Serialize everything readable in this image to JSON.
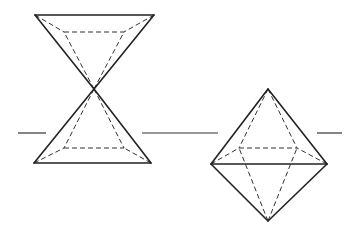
{
  "figure": {
    "stroke_color": "#222222",
    "background": "#ffffff"
  },
  "plane_line": {
    "y": 133,
    "segments": [
      [
        18,
        46
      ],
      [
        142,
        218
      ],
      [
        317,
        342
      ]
    ]
  },
  "double_pyramid": {
    "apex": [
      94,
      89
    ],
    "upper": {
      "front_left": [
        35,
        15
      ],
      "front_right": [
        154,
        15
      ],
      "back_left": [
        64,
        32
      ],
      "back_right": [
        124,
        32
      ]
    },
    "lower": {
      "front_left": [
        34,
        163
      ],
      "front_right": [
        151,
        163
      ],
      "back_left": [
        64,
        148
      ],
      "back_right": [
        124,
        148
      ]
    }
  },
  "octahedron": {
    "top": [
      268,
      89
    ],
    "bottom": [
      268,
      221
    ],
    "front_left": [
      211,
      164
    ],
    "front_right": [
      327,
      164
    ],
    "back_left": [
      239,
      148
    ],
    "back_right": [
      297,
      148
    ]
  }
}
